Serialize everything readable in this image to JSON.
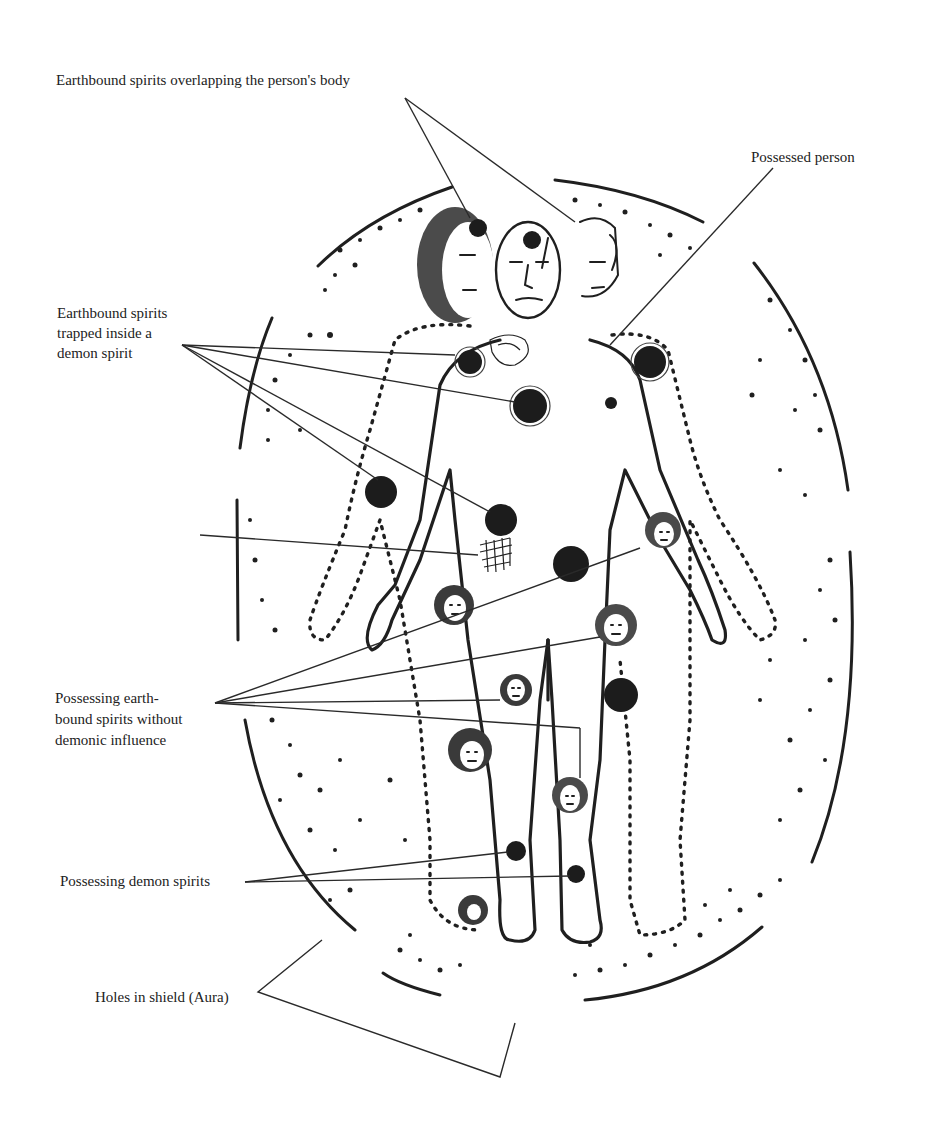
{
  "diagram": {
    "colors": {
      "ink": "#1f1f1f",
      "text": "#222222",
      "background": "#ffffff"
    },
    "labels": {
      "overlapping": "Earthbound spirits overlapping  the person's body",
      "possessed": "Possessed  person",
      "trapped": "Earthbound spirits\ntrapped inside a\ndemon spirit",
      "layers": "Spirits pressed in\ndifferent layers one\non top of the other",
      "earthbound": "Possessing  earth-\nbound spirits without\ndemonic influence",
      "demon": "Possessing demon spirits",
      "holes": "Holes in shield (Aura)"
    },
    "elements": {
      "aura_shield": "Dotted oval aura with broken solid outline (holes)",
      "central_figure": "Possessed person (solid outline)",
      "overlapping_figures": [
        "Left earthbound spirit (dark hair, dotted body)",
        "Right earthbound spirit (dotted body)"
      ],
      "dark_spirit_blobs": 9,
      "spirit_faces": 7
    }
  }
}
